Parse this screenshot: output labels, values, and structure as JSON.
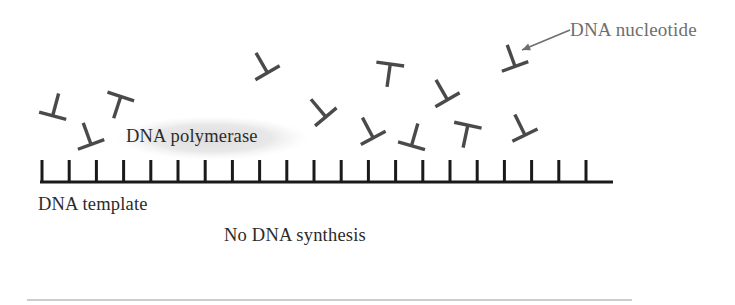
{
  "figure": {
    "background_color": "#ffffff",
    "width": 735,
    "height": 305
  },
  "labels": {
    "nucleotide": "DNA nucleotide",
    "polymerase": "DNA polymerase",
    "template": "DNA template",
    "caption": "No DNA synthesis"
  },
  "colors": {
    "nucleotide_stroke": "#4a4a4a",
    "template_stroke": "#1a1a1a",
    "polymerase_blob": "#e2e2e2",
    "callout_arrow": "#6e6e6e",
    "label_dark": "#2b2b2b",
    "label_gray": "#6e6e6e",
    "divider": "#9a9a9a"
  },
  "template_strand": {
    "baseline": {
      "x1": 40,
      "x2": 613,
      "y": 182,
      "stroke_width": 3
    },
    "tick_count": 21,
    "tick_start_x": 42,
    "tick_spacing": 27.2,
    "tick_height": 22,
    "tick_width": 3
  },
  "polymerase_blob": {
    "cx": 212,
    "cy": 138,
    "rx": 96,
    "ry": 22
  },
  "callout_arrow": {
    "x1": 570,
    "y1": 30,
    "x2": 522,
    "y2": 50,
    "head_size": 9
  },
  "divider": {
    "x1": 27,
    "x2": 632,
    "y": 300
  },
  "nucleotides": [
    {
      "id": "nt-1",
      "cx": 55,
      "cy": 107,
      "rotation": 195,
      "scale": 1.0
    },
    {
      "id": "nt-2",
      "cx": 118,
      "cy": 105,
      "rotation": 18,
      "scale": 1.0
    },
    {
      "id": "nt-3",
      "cx": 88,
      "cy": 136,
      "rotation": 160,
      "scale": 1.0
    },
    {
      "id": "nt-4",
      "cx": 263,
      "cy": 65,
      "rotation": 150,
      "scale": 1.0
    },
    {
      "id": "nt-5",
      "cx": 320,
      "cy": 110,
      "rotation": 140,
      "scale": 1.0
    },
    {
      "id": "nt-6",
      "cx": 389,
      "cy": 73,
      "rotation": 8,
      "scale": 1.0
    },
    {
      "id": "nt-7",
      "cx": 443,
      "cy": 92,
      "rotation": 150,
      "scale": 1.0
    },
    {
      "id": "nt-8",
      "cx": 512,
      "cy": 58,
      "rotation": 160,
      "scale": 1.0
    },
    {
      "id": "nt-9",
      "cx": 369,
      "cy": 130,
      "rotation": 152,
      "scale": 1.0
    },
    {
      "id": "nt-10",
      "cx": 414,
      "cy": 137,
      "rotation": 196,
      "scale": 1.0
    },
    {
      "id": "nt-11",
      "cx": 466,
      "cy": 134,
      "rotation": 12,
      "scale": 1.0
    },
    {
      "id": "nt-12",
      "cx": 521,
      "cy": 127,
      "rotation": 154,
      "scale": 1.0
    }
  ]
}
